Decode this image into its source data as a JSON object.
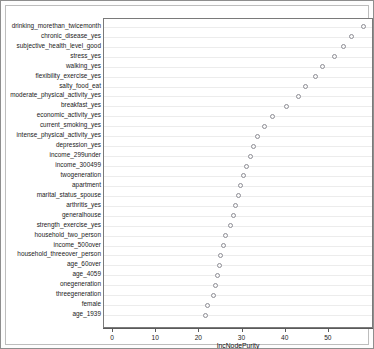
{
  "chart_data": {
    "type": "scatter",
    "title": "",
    "subtitle": "",
    "xlabel": "IncNodePurity",
    "ylabel": "",
    "xlim": [
      -2.1,
      60.0
    ],
    "xticks": [
      0,
      10,
      20,
      30,
      40,
      50
    ],
    "xticklabels": [
      "0",
      "10",
      "20",
      "30",
      "40",
      "50"
    ],
    "grid": "horizontal",
    "legend": "none",
    "orientation": "dotchart-descending",
    "categories": [
      "drinking_morethan_twicemonth",
      "chronic_disease_yes",
      "subjective_health_level_good",
      "stress_yes",
      "walking_yes",
      "flexibility_exercise_yes",
      "salty_food_eat",
      "moderate_physical_activity_yes",
      "breakfast_yes",
      "economic_activity_yes",
      "current_smoking_yes",
      "intense_physical_activity_yes",
      "depression_yes",
      "income_299under",
      "income_300499",
      "twogeneration",
      "apartment",
      "marital_status_spouse",
      "arthritis_yes",
      "generalhouse",
      "strength_exercise_yes",
      "household_two_person",
      "income_500over",
      "household_threeover_person",
      "age_60over",
      "age_4059",
      "onegeneration",
      "threegeneration",
      "female",
      "age_1939"
    ],
    "values": [
      58.0,
      55.3,
      53.4,
      51.2,
      48.5,
      46.8,
      44.6,
      42.9,
      40.2,
      37.0,
      35.1,
      33.4,
      32.5,
      31.9,
      31.0,
      30.2,
      29.6,
      29.0,
      28.4,
      27.8,
      27.2,
      26.0,
      25.6,
      25.0,
      24.6,
      24.2,
      23.7,
      23.2,
      21.9,
      21.4
    ]
  }
}
